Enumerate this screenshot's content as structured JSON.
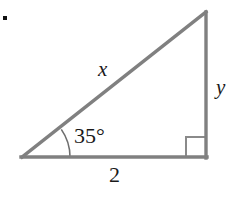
{
  "figure": {
    "type": "right-triangle-diagram",
    "bullet_marker": "•",
    "labels": {
      "hypotenuse": "x",
      "vertical_leg": "y",
      "base": "2",
      "angle": "35°"
    },
    "colors": {
      "stroke": "#808080",
      "arc_stroke": "#6e6e6e",
      "right_angle_stroke": "#8a8a8a",
      "text": "#1a1a1a",
      "background": "#ffffff",
      "bullet": "#111111"
    },
    "geometry": {
      "left_vertex": [
        22,
        157
      ],
      "right_angle_vertex": [
        206,
        157
      ],
      "top_vertex": [
        206,
        12
      ],
      "arc_radius": 48,
      "right_angle_box_size": 20,
      "stroke_width": 3
    }
  }
}
